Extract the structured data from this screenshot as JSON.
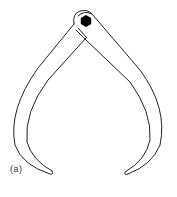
{
  "figure": {
    "label": "(a)",
    "colors": {
      "stroke": "#222222",
      "pivot": "#000000",
      "background": "#ffffff"
    }
  }
}
